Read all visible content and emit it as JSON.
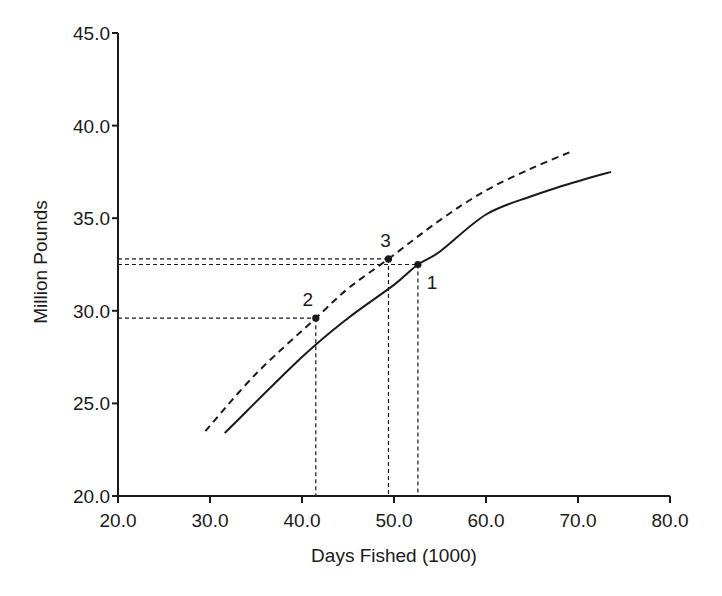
{
  "chart_data": {
    "type": "line",
    "title": "",
    "xlabel": "Days Fished (1000)",
    "ylabel": "Million Pounds",
    "xlim": [
      20,
      80
    ],
    "ylim": [
      20,
      45
    ],
    "x_ticks": [
      "20.0",
      "30.0",
      "40.0",
      "50.0",
      "60.0",
      "70.0",
      "80.0"
    ],
    "y_ticks": [
      "20.0",
      "25.0",
      "30.0",
      "35.0",
      "40.0",
      "45.0"
    ],
    "grid": false,
    "legend": null,
    "series": [
      {
        "name": "solid curve",
        "style": "solid",
        "x": [
          31.6,
          40.0,
          45.0,
          50.0,
          52.6,
          55.0,
          60.0,
          65.0,
          70.0,
          73.6
        ],
        "y": [
          23.4,
          27.5,
          29.6,
          31.4,
          32.5,
          33.2,
          35.2,
          36.2,
          37.0,
          37.5
        ]
      },
      {
        "name": "dashed curve",
        "style": "dashed",
        "x": [
          29.5,
          35.0,
          41.5,
          45.0,
          49.4,
          55.0,
          60.0,
          65.0,
          69.3
        ],
        "y": [
          23.5,
          26.6,
          29.6,
          31.2,
          32.8,
          34.9,
          36.5,
          37.7,
          38.6
        ]
      }
    ],
    "annotations": [
      {
        "label": "1",
        "x": 52.6,
        "y": 32.5,
        "on": "solid curve"
      },
      {
        "label": "2",
        "x": 41.5,
        "y": 29.6,
        "on": "dashed curve"
      },
      {
        "label": "3",
        "x": 49.4,
        "y": 32.8,
        "on": "dashed curve"
      }
    ],
    "reference_lines": "dashed drop lines from each annotated point to both axes"
  },
  "colors": {
    "ink": "#1a1a1a",
    "background": "#ffffff"
  }
}
